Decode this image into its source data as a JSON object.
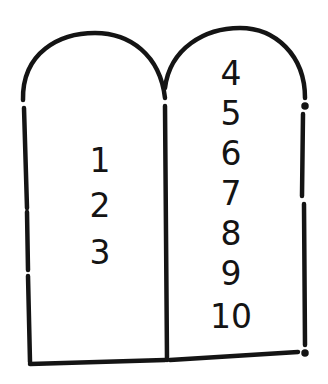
{
  "illustration": {
    "subject": "two stone tablets",
    "stroke_color": "#141414",
    "background_color": "#ffffff",
    "left_tablet": {
      "numbers": [
        "1",
        "2",
        "3"
      ]
    },
    "right_tablet": {
      "numbers": [
        "4",
        "5",
        "6",
        "7",
        "8",
        "9",
        "10"
      ]
    }
  }
}
